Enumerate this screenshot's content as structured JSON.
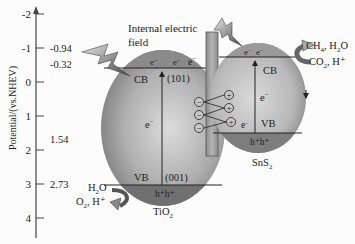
{
  "axis": {
    "label": "Potential/(vs.NHEV)",
    "ticks": [
      {
        "label": "-2",
        "y": 14
      },
      {
        "label": "-1",
        "y": 48
      },
      {
        "label": "0",
        "y": 82
      },
      {
        "label": "1",
        "y": 116
      },
      {
        "label": "2",
        "y": 150
      },
      {
        "label": "3",
        "y": 184
      },
      {
        "label": "4",
        "y": 218
      }
    ],
    "values": {
      "tio2_cb": "-0.94",
      "sns2_cb": "-0.32",
      "sns2_vb": "1.54",
      "tio2_vb": "2.73"
    }
  },
  "title": {
    "line1": "Internal electric",
    "line2": "field"
  },
  "tio2": {
    "name": "TiO",
    "sub": "2",
    "cb": "CB",
    "vb": "VB",
    "facet_top": "(101)",
    "facet_bottom": "(001)",
    "electron": "e",
    "cb_electrons": [
      "e",
      "e"
    ],
    "holes": "h⁺h⁺",
    "reactant": "H",
    "reactant_sub": "2",
    "reactant_tail": "O",
    "products": "O",
    "products_sub": "2",
    "products_tail": ",  H⁺"
  },
  "sns2": {
    "name": "SnS",
    "sub": "2",
    "cb": "CB",
    "vb": "VB",
    "electron": "e",
    "cb_electrons": [
      "e",
      "e"
    ],
    "vb_electron": "e",
    "holes": "h⁺h⁺",
    "product_line": "CH",
    "product_sub": "4",
    "product_tail": ",  H",
    "product_sub2": "2",
    "product_tail2": "O",
    "reactant_line": "CO",
    "reactant_sub": "2",
    "reactant_tail": ",  H⁺"
  },
  "interface": {
    "transfer_electron": "e",
    "neg_charges": [
      "−",
      "−",
      "−"
    ],
    "pos_charges": [
      "+",
      "+",
      "+"
    ]
  },
  "colors": {
    "background": "#fcfcfc",
    "particle_light": "#d9d9d9",
    "particle_dark": "#7a7a7a",
    "band_dark": "#6d6d6d",
    "bar": "#9a9a9a",
    "line": "#333333"
  }
}
